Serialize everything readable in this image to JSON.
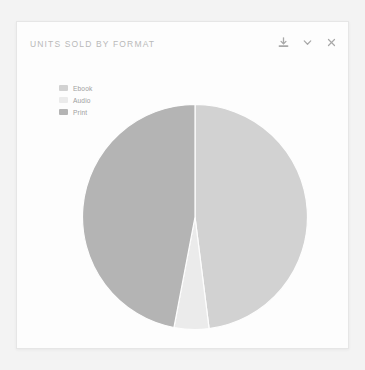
{
  "card": {
    "title": "UNITS SOLD BY FORMAT",
    "background": "#fdfdfd",
    "border_color": "#e6e6e6"
  },
  "page": {
    "background": "#f3f3f3"
  },
  "toolbar": {
    "download_label": "download-icon",
    "collapse_label": "chevron-down-icon",
    "close_label": "close-icon",
    "icon_color": "#a8a8a8"
  },
  "legend": {
    "position": "top-left",
    "items": [
      {
        "label": "Ebook",
        "color": "#d2d2d2"
      },
      {
        "label": "Audio",
        "color": "#ebebeb"
      },
      {
        "label": "Print",
        "color": "#b4b4b4"
      }
    ]
  },
  "chart_data": {
    "type": "pie",
    "title": "UNITS SOLD BY FORMAT",
    "xlabel": "",
    "ylabel": "",
    "legend_position": "top-left",
    "grid": false,
    "start_angle_deg": 0,
    "direction": "clockwise",
    "categories": [
      "Ebook",
      "Audio",
      "Print"
    ],
    "values": [
      48,
      5,
      47
    ],
    "colors": [
      "#d2d2d2",
      "#ebebeb",
      "#b4b4b4"
    ],
    "slices": [
      {
        "label": "Ebook",
        "value": 48,
        "percent": "48%",
        "color": "#d2d2d2",
        "start_deg": 0,
        "end_deg": 172.8
      },
      {
        "label": "Audio",
        "value": 5,
        "percent": "5%",
        "color": "#ebebeb",
        "start_deg": 172.8,
        "end_deg": 190.8
      },
      {
        "label": "Print",
        "value": 47,
        "percent": "47%",
        "color": "#b4b4b4",
        "start_deg": 190.8,
        "end_deg": 360
      }
    ]
  }
}
